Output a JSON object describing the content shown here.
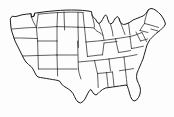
{
  "figure": {
    "kind": "line-art-map",
    "title": "",
    "caption": "",
    "label_text": "",
    "has_labels": false,
    "has_legend": false,
    "has_border": false
  },
  "canvas": {
    "width": 174,
    "height": 117,
    "background_color": "#fdfdfd"
  },
  "style": {
    "stroke_color": "#2b2b2b",
    "outline_color": "#1d1d1d",
    "fill_color": "none",
    "state_stroke_width": 0.75,
    "outline_stroke_width": 1.0
  },
  "extent": {
    "left": 10,
    "right": 170,
    "top": 8,
    "bottom": 104
  },
  "regions": [
    {
      "name": "pacific-northwest",
      "states": [
        "Washington",
        "Oregon",
        "Idaho"
      ]
    },
    {
      "name": "west-coast",
      "states": [
        "California",
        "Nevada"
      ]
    },
    {
      "name": "southwest",
      "states": [
        "Arizona",
        "New Mexico",
        "Utah",
        "Colorado"
      ]
    },
    {
      "name": "northern-rockies",
      "states": [
        "Montana",
        "Wyoming"
      ]
    },
    {
      "name": "great-plains",
      "states": [
        "North Dakota",
        "South Dakota",
        "Nebraska",
        "Kansas",
        "Oklahoma",
        "Texas"
      ]
    },
    {
      "name": "upper-midwest",
      "states": [
        "Minnesota",
        "Iowa",
        "Wisconsin",
        "Michigan",
        "Illinois",
        "Indiana",
        "Ohio",
        "Missouri"
      ]
    },
    {
      "name": "south-central",
      "states": [
        "Arkansas",
        "Louisiana",
        "Mississippi",
        "Alabama",
        "Tennessee",
        "Kentucky"
      ]
    },
    {
      "name": "southeast",
      "states": [
        "Florida",
        "Georgia",
        "South Carolina",
        "North Carolina"
      ]
    },
    {
      "name": "mid-atlantic",
      "states": [
        "Virginia",
        "West Virginia",
        "Maryland",
        "Delaware",
        "Pennsylvania",
        "New Jersey",
        "New York"
      ]
    },
    {
      "name": "new-england",
      "states": [
        "Maine",
        "New Hampshire",
        "Vermont",
        "Massachusetts",
        "Rhode Island",
        "Connecticut"
      ]
    }
  ],
  "geometry": {
    "national_outline": "M10.5,18.5 L12.2,16.2 L14.8,16.6 L18.0,16.0 L22.0,14.8 L26.5,14.2 L31.0,13.6 L31.4,17.0 L34.0,16.2 L34.6,13.2 L39.0,12.6 L44.0,11.9 L49.5,11.3 L55.0,10.8 L60.5,10.4 L66.0,10.1 L71.5,10.0 L77.0,10.1 L82.5,10.4 L88.0,11.0 L91.5,11.6 L92.0,15.0 L93.5,17.5 L95.5,19.0 L97.0,22.0 L99.0,23.5 L101.0,22.0 L102.5,19.5 L104.0,16.8 L105.5,14.8 L107.0,16.5 L107.8,19.5 L109.0,22.5 L110.5,24.0 L112.5,23.0 L114.0,20.5 L115.5,18.0 L117.5,16.5 L119.0,18.5 L120.0,21.5 L121.5,23.5 L123.5,24.5 L126.0,24.0 L128.5,23.0 L131.0,21.5 L133.0,20.0 L135.5,19.0 L138.0,18.0 L140.5,17.0 L143.0,16.0 L145.0,14.5 L147.0,12.0 L148.5,9.5 L151.0,8.5 L153.5,9.0 L156.0,10.5 L158.5,12.5 L161.0,15.0 L163.0,18.0 L164.5,21.0 L165.5,24.0 L164.0,26.5 L162.0,28.5 L160.0,30.5 L158.0,32.0 L156.0,33.5 L154.0,35.5 L152.0,37.5 L150.0,39.5 L148.5,42.0 L147.0,45.0 L146.0,48.5 L145.0,52.0 L144.0,55.5 L143.0,59.0 L141.5,62.5 L140.0,66.0 L138.5,69.5 L137.0,73.0 L136.5,76.5 L137.0,80.0 L138.5,83.5 L140.0,87.0 L140.5,90.5 L140.0,94.0 L138.5,97.5 L136.5,100.0 L134.0,101.0 L132.0,99.5 L130.5,96.5 L129.5,93.0 L128.5,89.5 L127.5,86.5 L126.0,85.0 L123.0,85.5 L119.5,86.0 L116.0,86.5 L112.5,87.0 L109.0,87.5 L105.5,88.0 L102.5,89.5 L100.0,91.5 L98.0,93.5 L96.0,95.0 L94.0,94.0 L92.5,92.0 L91.0,89.5 L89.5,90.5 L88.0,93.0 L86.5,96.0 L85.0,99.0 L83.0,101.5 L80.5,103.0 L78.0,102.0 L76.0,99.5 L74.5,96.5 L73.0,93.5 L71.0,91.0 L68.5,89.0 L66.0,87.5 L63.5,86.0 L61.5,84.0 L60.0,81.5 L58.0,80.5 L55.5,80.0 L52.5,79.5 L49.5,79.0 L46.5,78.5 L43.5,78.0 L40.5,77.5 L38.0,77.0 L36.0,75.0 L34.5,72.0 L33.0,69.0 L31.0,66.5 L28.5,64.5 L26.0,62.0 L24.0,59.0 L22.5,56.0 L21.0,53.0 L19.5,50.0 L18.0,47.0 L16.5,44.0 L15.0,41.0 L14.0,38.0 L13.0,35.0 L12.0,32.0 L11.2,29.0 L10.8,26.0 L10.5,22.5 Z",
    "state_borders": [
      "M31.0,13.6 L31.4,17.0 L34.0,16.2 L34.6,13.2",
      "M31.4,17.0 L33.0,21.0 L35.0,25.0 L36.5,27.5",
      "M12.2,29.0 L18.0,28.5 L24.0,28.0 L30.5,27.6 L36.5,27.5",
      "M36.5,27.5 L37.0,23.0 L37.6,18.5 L38.2,14.2",
      "M36.5,27.5 L36.8,32.0 L37.2,36.5 L37.6,41.0",
      "M14.0,38.0 L20.5,38.0 L27.0,38.2 L33.5,38.4 L37.6,38.6",
      "M37.6,41.0 L44.0,41.0 L50.5,41.0 L57.0,41.0",
      "M38.2,14.2 L44.5,13.6 L51.0,13.0 L57.5,12.6 L64.0,12.3",
      "M57.0,26.5 L57.2,21.0 L57.4,16.0 L57.6,12.4",
      "M38.0,27.8 L44.5,27.4 L51.0,27.0 L57.0,26.6",
      "M57.0,26.6 L57.0,33.5 L57.0,41.0",
      "M64.0,12.3 L64.2,18.0 L64.4,24.0 L64.6,30.0",
      "M57.0,26.6 L64.6,26.8 L71.5,27.0 L78.0,27.2",
      "M64.0,12.3 L70.5,12.1 L77.0,12.2 L83.0,12.5",
      "M78.0,12.3 L78.0,19.5 L78.0,27.2",
      "M78.0,27.2 L78.2,34.0 L78.4,41.0 L78.5,47.5",
      "M57.0,41.0 L57.0,48.0 L57.0,55.0",
      "M37.6,41.0 L37.8,48.0 L38.0,55.0 L38.2,62.0 L38.4,69.0",
      "M22.5,56.0 L29.0,55.8 L35.0,55.6 L38.0,55.5",
      "M38.0,55.5 L45.0,55.3 L51.5,55.1 L57.0,55.0",
      "M57.0,55.0 L57.2,62.0 L57.4,69.0 L57.6,76.0",
      "M38.4,69.0 L45.0,69.0 L51.5,69.0 L57.4,69.0",
      "M57.4,69.0 L64.0,69.0 L70.5,69.0 L77.0,69.0",
      "M57.0,55.0 L64.0,55.0 L70.5,55.0 L77.5,55.0",
      "M77.5,41.0 L77.8,48.0 L78.0,55.0 L78.2,62.0 L78.4,69.0",
      "M78.4,69.0 L79.0,72.5 L80.0,76.0 L81.0,79.0",
      "M78.0,27.2 L84.5,27.4 L91.0,27.6 L94.0,28.0",
      "M83.0,12.5 L83.5,18.0 L84.0,23.5 L84.5,27.4",
      "M84.5,27.4 L85.0,32.5 L85.5,37.5 L86.0,42.0",
      "M86.0,42.0 L92.0,41.5 L97.5,41.0 L102.0,40.6",
      "M86.0,42.0 L86.5,47.0 L87.0,52.0 L87.5,56.5",
      "M87.5,56.5 L93.0,55.8 L98.0,55.2 L102.5,54.8",
      "M78.2,62.0 L84.0,61.5 L89.5,61.0 L94.5,60.6",
      "M94.5,60.6 L95.5,65.0 L96.5,69.5 L97.5,73.5",
      "M94.5,60.6 L99.5,60.0 L104.5,59.5 L109.0,59.0",
      "M97.5,73.5 L97.8,78.0 L98.0,82.5 L98.2,87.5",
      "M97.5,73.5 L103.0,73.0 L108.0,72.5 L112.5,72.0",
      "M106.5,72.3 L107.0,77.0 L107.5,81.5 L108.0,86.5",
      "M112.5,72.0 L113.0,76.5 L113.5,81.0 L114.0,86.3",
      "M109.0,59.0 L109.5,63.0 L110.0,67.0 L110.5,71.0",
      "M102.5,54.8 L103.0,51.0 L103.5,47.0 L104.0,43.0",
      "M109.0,59.0 L114.0,58.3 L119.0,57.6 L124.0,57.0",
      "M124.0,57.0 L124.5,61.5 L125.0,66.0 L125.5,70.5",
      "M119.5,70.7 L124.5,70.0 L129.0,69.3 L133.5,68.6",
      "M125.5,70.5 L126.0,75.0 L126.5,79.5 L127.0,84.5",
      "M127.0,84.5 L127.5,86.5",
      "M102.0,40.6 L106.5,40.0 L111.0,39.4 L115.5,38.8",
      "M115.5,38.8 L116.5,43.5 L117.5,48.0 L118.5,52.5",
      "M118.5,52.5 L122.0,52.0 L126.0,51.4 L130.5,50.5",
      "M104.0,43.0 L108.5,42.5 L113.0,42.0 L117.0,41.5",
      "M115.5,38.8 L120.5,38.0 L125.5,37.2 L130.0,36.5",
      "M130.0,36.5 L130.5,40.5 L131.0,44.5 L131.5,48.5",
      "M124.0,57.0 L128.5,56.2 L133.0,55.4 L137.0,54.6",
      "M131.5,48.5 L135.5,47.8 L139.5,47.0 L143.5,46.2",
      "M130.0,36.5 L134.0,35.5 L138.0,34.0 L142.0,32.5",
      "M142.0,32.5 L143.5,35.5 L145.0,38.5 L146.5,41.5",
      "M136.0,32.0 L137.5,35.0 L139.0,38.0 L140.5,41.0",
      "M140.5,41.0 L144.0,40.0 L147.5,39.0",
      "M148.5,24.5 L152.0,25.5 L155.5,26.5 L158.5,27.5",
      "M151.0,29.0 L154.5,30.0 L158.0,31.0",
      "M148.5,9.5 L147.0,13.0 L146.0,16.5 L145.0,20.0 L144.5,23.5",
      "M144.5,23.5 L148.5,24.5",
      "M144.5,23.5 L142.0,27.0 L140.0,30.5",
      "M140.0,30.5 L144.0,31.5 L148.0,32.5",
      "M128.5,23.0 L129.0,27.0 L129.5,31.0 L130.0,35.0",
      "M119.0,18.5 L120.5,22.5 L122.0,26.5 L123.5,30.5 L125.0,34.5",
      "M110.5,24.0 L111.5,28.0 L112.5,32.0 L113.0,36.0",
      "M99.0,23.5 L100.5,27.5 L102.0,31.5 L103.0,35.5 L104.0,40.0",
      "M94.0,28.0 L96.0,30.5 L98.5,32.0 L101.0,33.5 L103.0,35.5",
      "M92.0,15.0 L93.0,19.0 L94.0,23.0 L94.5,27.0"
    ]
  }
}
